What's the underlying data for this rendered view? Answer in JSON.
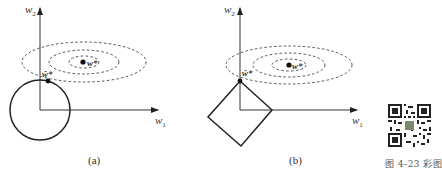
{
  "panels": [
    {
      "id": "a",
      "caption": "(a)",
      "x_axis_label": "w",
      "x_axis_sub": "1",
      "y_axis_label": "w",
      "y_axis_sub": "2",
      "constraint_shape": "circle (L2 norm ball)",
      "optimum_label": "w*",
      "regularized_optimum_label": "ŵ*"
    },
    {
      "id": "b",
      "caption": "(b)",
      "x_axis_label": "w",
      "x_axis_sub": "1",
      "y_axis_label": "w",
      "y_axis_sub": "2",
      "constraint_shape": "diamond (L1 norm ball)",
      "optimum_label": "w*",
      "regularized_optimum_label": "ŵ*"
    }
  ],
  "qr_caption": "图 4-23 彩图",
  "colors": {
    "line": "#222222",
    "contour": "#444444",
    "text": "#333333"
  }
}
